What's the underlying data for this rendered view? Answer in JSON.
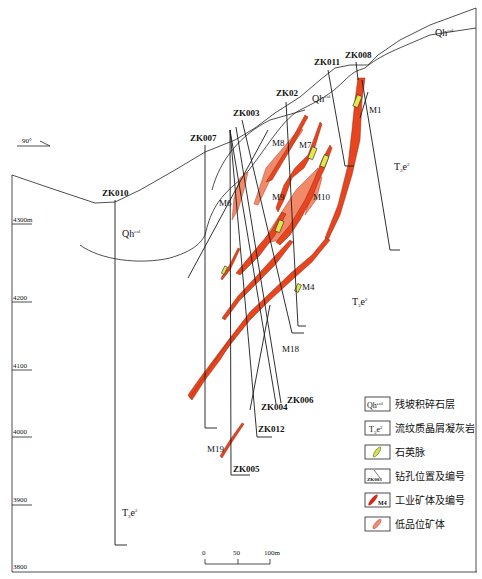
{
  "orientation": {
    "label": "90°"
  },
  "elevation_axis": {
    "ticks": [
      {
        "label": "4300m",
        "y": 170
      },
      {
        "label": "4200",
        "y": 297
      },
      {
        "label": "4100",
        "y": 364
      },
      {
        "label": "4000",
        "y": 432
      },
      {
        "label": "3900",
        "y": 500
      },
      {
        "label": "3800",
        "y": 567
      }
    ]
  },
  "drill_holes": [
    {
      "id": "ZK010",
      "label": "ZK010"
    },
    {
      "id": "ZK007",
      "label": "ZK007"
    },
    {
      "id": "ZK003",
      "label": "ZK003"
    },
    {
      "id": "ZK02",
      "label": "ZK02"
    },
    {
      "id": "ZK011",
      "label": "ZK011"
    },
    {
      "id": "ZK008",
      "label": "ZK008"
    },
    {
      "id": "ZK006",
      "label": "ZK006"
    },
    {
      "id": "ZK004",
      "label": "ZK004"
    },
    {
      "id": "ZK012",
      "label": "ZK012"
    },
    {
      "id": "ZK005",
      "label": "ZK005"
    }
  ],
  "ore_bodies": [
    {
      "id": "M1",
      "label": "M1"
    },
    {
      "id": "M4",
      "label": "M4"
    },
    {
      "id": "M6",
      "label": "M6"
    },
    {
      "id": "M7",
      "label": "M7"
    },
    {
      "id": "M8",
      "label": "M8"
    },
    {
      "id": "M9",
      "label": "M9"
    },
    {
      "id": "M10",
      "label": "M10"
    },
    {
      "id": "M18",
      "label": "M18"
    },
    {
      "id": "M19",
      "label": "M19"
    }
  ],
  "strata_labels": {
    "qh_main": "Qh",
    "qh_sup": "eol",
    "t_main": "T",
    "t_sub": "3",
    "t_e": "e",
    "t_sup": "2"
  },
  "scale_bar": {
    "ticks": [
      "0",
      "50",
      "100m"
    ]
  },
  "legend": {
    "items": [
      {
        "symbol": "Qh^eol",
        "label": "残坡积碎石层"
      },
      {
        "symbol": "T3e2",
        "label": "流纹质晶屑凝灰岩"
      },
      {
        "symbol": "quartz-vein",
        "label": "石英脉"
      },
      {
        "symbol": "drill-hole",
        "symbol_text": "ZK003",
        "label": "钻孔位置及编号"
      },
      {
        "symbol": "industrial-ore",
        "symbol_text": "M4",
        "label": "工业矿体及编号"
      },
      {
        "symbol": "low-grade-ore",
        "label": "低品位矿体"
      }
    ]
  },
  "colors": {
    "ore": "#e8451f",
    "low_grade_ore": "#f28a6a",
    "quartz": "#e6e84a",
    "line": "#222222"
  }
}
